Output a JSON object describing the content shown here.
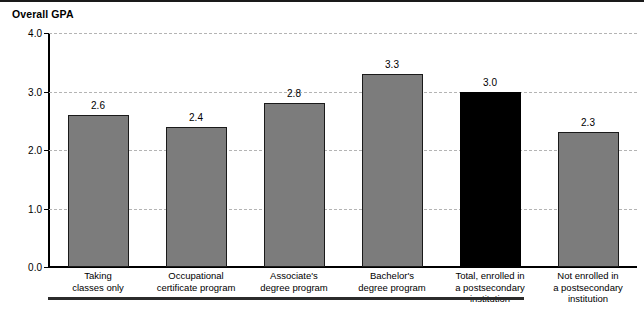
{
  "chart_data": {
    "type": "bar",
    "title": "Overall GPA",
    "xlabel": "",
    "ylabel": "",
    "ylim": [
      0.0,
      4.0
    ],
    "grid": true,
    "legend": "none",
    "yticks": [
      "0.0",
      "1.0",
      "2.0",
      "3.0",
      "4.0"
    ],
    "ytick_values": [
      0.0,
      1.0,
      2.0,
      3.0,
      4.0
    ],
    "categories": [
      "Taking\nclasses only",
      "Occupational\ncertificate program",
      "Associate's\ndegree program",
      "Bachelor's\ndegree program",
      "Total, enrolled in\na postsecondary\ninstitution",
      "Not enrolled in\na postsecondary\ninstitution"
    ],
    "category_lines": [
      [
        "Taking",
        "classes only"
      ],
      [
        "Occupational",
        "certificate program"
      ],
      [
        "Associate's",
        "degree program"
      ],
      [
        "Bachelor's",
        "degree program"
      ],
      [
        "Total, enrolled in",
        "a postsecondary",
        "institution"
      ],
      [
        "Not enrolled in",
        "a postsecondary",
        "institution"
      ]
    ],
    "values": [
      2.6,
      2.4,
      2.8,
      3.3,
      3.0,
      2.3
    ],
    "value_labels": [
      "2.6",
      "2.4",
      "2.8",
      "3.3",
      "3.0",
      "2.3"
    ],
    "bar_colors": [
      "#7c7c7c",
      "#7c7c7c",
      "#7c7c7c",
      "#7c7c7c",
      "#000000",
      "#7c7c7c"
    ],
    "highlight_index": 4,
    "colors": {
      "bar_gray": "#7c7c7c",
      "bar_black": "#000000",
      "bar_border": "#1a1a1a",
      "gridline": "#b4b4b4",
      "axis": "#000000",
      "text": "#000000",
      "background": "#ffffff"
    }
  }
}
